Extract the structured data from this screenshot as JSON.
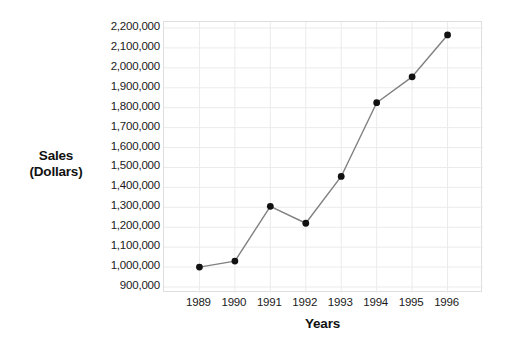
{
  "chart_data": {
    "type": "line",
    "title": "",
    "subtitle": "",
    "xlabel": "Years",
    "ylabel": "Sales\n(Dollars)",
    "ylabel_lines": [
      "Sales",
      "(Dollars)"
    ],
    "categories": [
      "1989",
      "1990",
      "1991",
      "1992",
      "1993",
      "1994",
      "1995",
      "1996"
    ],
    "x": [
      1989,
      1990,
      1991,
      1992,
      1993,
      1994,
      1995,
      1996
    ],
    "values": [
      1000000,
      1030000,
      1305000,
      1220000,
      1455000,
      1825000,
      1955000,
      2165000
    ],
    "series": [
      {
        "name": "Sales",
        "values": [
          1000000,
          1030000,
          1305000,
          1220000,
          1455000,
          1825000,
          1955000,
          2165000
        ]
      }
    ],
    "ylim": [
      900000,
      2200000
    ],
    "ytick_step": 100000,
    "ytick_labels": [
      "2,200,000",
      "2,100,000",
      "2,000,000",
      "1,900,000",
      "1,800,000",
      "1,700,000",
      "1,600,000",
      "1,500,000",
      "1,400,000",
      "1,300,000",
      "1,200,000",
      "1,100,000",
      "1,000,000",
      "900,000"
    ],
    "ytick_values": [
      2200000,
      2100000,
      2000000,
      1900000,
      1800000,
      1700000,
      1600000,
      1500000,
      1400000,
      1300000,
      1200000,
      1100000,
      1000000,
      900000
    ],
    "grid": true,
    "grid_x": true,
    "grid_y": true,
    "legend": false,
    "legend_position": "none",
    "marker": "filled-circle",
    "colors": {
      "line": "#808080",
      "marker": "#111111",
      "grid": "#ebebeb",
      "plot_border": "#dedede",
      "background": "#ffffff",
      "text": "#1a1a1a"
    }
  }
}
